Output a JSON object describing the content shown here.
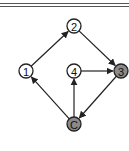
{
  "diagram": {
    "type": "directed-graph",
    "nodes": [
      {
        "id": "1",
        "label": "1",
        "x": 26,
        "y": 71,
        "filled": false
      },
      {
        "id": "2",
        "label": "2",
        "x": 74,
        "y": 26,
        "filled": false
      },
      {
        "id": "3",
        "label": "3",
        "x": 121,
        "y": 71,
        "filled": true
      },
      {
        "id": "4",
        "label": "4",
        "x": 74,
        "y": 71,
        "filled": false
      },
      {
        "id": "C",
        "label": "C",
        "x": 74,
        "y": 124,
        "filled": true
      }
    ],
    "edges": [
      {
        "from": "1",
        "to": "2"
      },
      {
        "from": "2",
        "to": "3"
      },
      {
        "from": "4",
        "to": "3"
      },
      {
        "from": "3",
        "to": "C"
      },
      {
        "from": "C",
        "to": "1"
      },
      {
        "from": "C",
        "to": "4"
      }
    ],
    "colors": {
      "stroke": "#222222",
      "fill_highlight": "#8a8a8a",
      "fill_normal": "#ffffff"
    }
  }
}
